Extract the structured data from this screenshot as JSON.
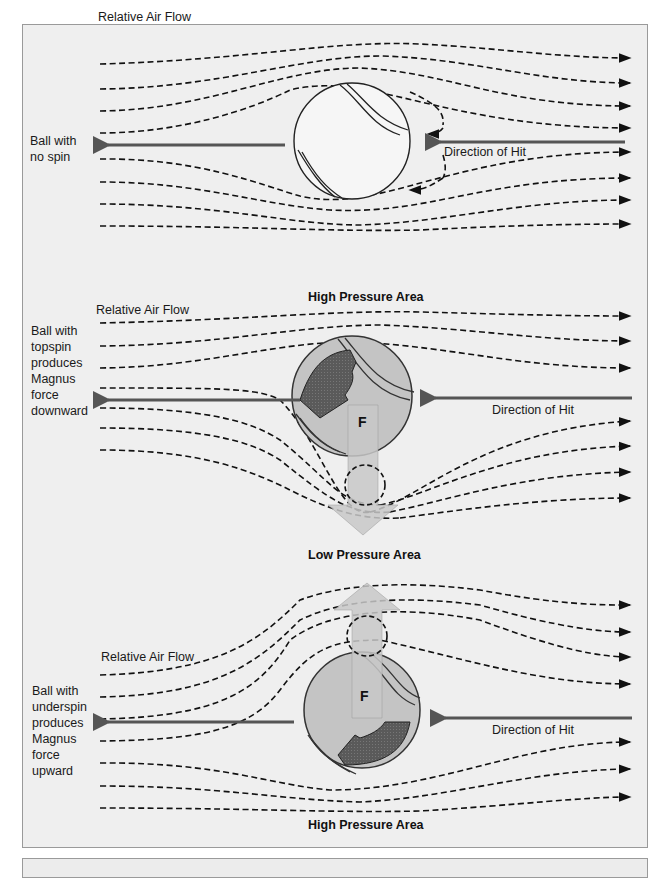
{
  "panels": {
    "no_spin": {
      "air_flow_label": "Relative Air Flow",
      "ball_label": "Ball with\nno spin",
      "hit_label": "Direction of Hit"
    },
    "topspin": {
      "top_area_label": "High Pressure Area",
      "air_flow_label": "Relative Air Flow",
      "ball_label": "Ball with\ntopspin\nproduces\nMagnus\nforce\ndownward",
      "hit_label": "Direction of Hit",
      "force_label": "F",
      "bottom_area_label": "Low Pressure Area"
    },
    "underspin": {
      "air_flow_label": "Relative Air Flow",
      "ball_label": "Ball with\nunderspin\nproduces\nMagnus\nforce\nupward",
      "hit_label": "Direction of Hit",
      "force_label": "F",
      "bottom_area_label": "High Pressure Area"
    }
  },
  "colors": {
    "background": "#efefef",
    "ball_fill": "#bdbdbd",
    "spin_arrow": "#555555",
    "force_arrow": "#c8c8c8",
    "hit_arrow": "#555555"
  }
}
